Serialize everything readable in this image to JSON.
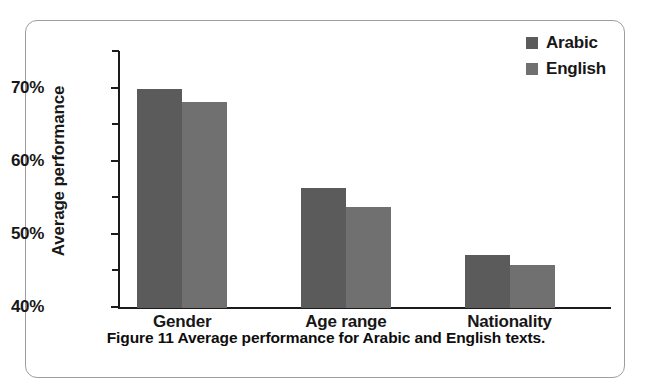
{
  "figure": {
    "caption_label": "Figure",
    "caption_number": "11",
    "caption_text": "Average performance for Arabic and English texts.",
    "frame_color": "#9d9d9d",
    "background": "#ffffff"
  },
  "legend": {
    "position": "top-right",
    "entries": [
      {
        "label": "Arabic",
        "color": "#5b5b5b",
        "swatch_name": "legend-swatch-arabic"
      },
      {
        "label": "English",
        "color": "#707070",
        "swatch_name": "legend-swatch-english"
      }
    ]
  },
  "axes": {
    "y_label": "Average performance",
    "y_ticks_major": [
      "70%",
      "60%",
      "50%",
      "40%"
    ],
    "y_tick_values": [
      70,
      60,
      50,
      40
    ],
    "y_minor_values": [
      75,
      65,
      55,
      45
    ],
    "x_labels": [
      "Gender",
      "Age range",
      "Nationality"
    ]
  },
  "chart_data": {
    "type": "bar",
    "title": "Average performance for Arabic and English texts.",
    "xlabel": "",
    "ylabel": "Average performance",
    "ylim": [
      40,
      75
    ],
    "ytick_values": [
      40,
      50,
      60,
      70
    ],
    "ytick_labels": [
      "40%",
      "50%",
      "60%",
      "70%"
    ],
    "yminor_ticks": [
      45,
      55,
      65,
      75
    ],
    "grid": false,
    "legend_position": "top-right",
    "value_unit": "percent",
    "categories": [
      "Gender",
      "Age range",
      "Nationality"
    ],
    "series": [
      {
        "name": "Arabic",
        "color": "#5b5b5b",
        "values": [
          70.0,
          56.4,
          47.3
        ]
      },
      {
        "name": "English",
        "color": "#707070",
        "values": [
          68.1,
          53.8,
          45.9
        ]
      }
    ]
  }
}
